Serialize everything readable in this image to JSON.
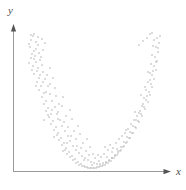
{
  "figure": {
    "width": 186,
    "height": 190,
    "background": "#ffffff",
    "type": "scatter-plot-figure"
  },
  "axes": {
    "color": "#9a9a9a",
    "arrow_color": "#555555",
    "line_width": 1,
    "origin": {
      "x": 13,
      "y": 172
    },
    "x_axis": {
      "from_x": 13,
      "to_x": 170,
      "y": 172,
      "arrow": "right-arrowhead"
    },
    "y_axis": {
      "x": 13,
      "from_y": 172,
      "to_y": 26,
      "arrow": "up-arrowhead"
    },
    "x_label": "x",
    "y_label": "y",
    "tick_labels_x": [],
    "tick_labels_y": []
  },
  "chart_data": {
    "type": "scatter",
    "title": "",
    "subtitle": "",
    "xlabel": "x",
    "ylabel": "y",
    "xlim": [
      0,
      186
    ],
    "ylim": [
      0,
      190
    ],
    "grid": false,
    "legend": null,
    "annotations": [],
    "marker": {
      "shape": "square-dot",
      "size_px": 1.4,
      "color": "#b4b4b4",
      "opacity": 0.95
    },
    "relationship": "u-shaped / quadratic",
    "vertex_px": {
      "x": 97,
      "y": 163
    },
    "n_points": 243,
    "points": [
      [
        31,
        40
      ],
      [
        33,
        36
      ],
      [
        36,
        42
      ],
      [
        30,
        47
      ],
      [
        34,
        51
      ],
      [
        38,
        45
      ],
      [
        35,
        56
      ],
      [
        31,
        58
      ],
      [
        39,
        53
      ],
      [
        36,
        62
      ],
      [
        33,
        66
      ],
      [
        40,
        60
      ],
      [
        37,
        71
      ],
      [
        42,
        65
      ],
      [
        34,
        74
      ],
      [
        39,
        78
      ],
      [
        43,
        72
      ],
      [
        37,
        82
      ],
      [
        41,
        86
      ],
      [
        45,
        79
      ],
      [
        39,
        90
      ],
      [
        44,
        93
      ],
      [
        48,
        86
      ],
      [
        42,
        97
      ],
      [
        46,
        101
      ],
      [
        50,
        94
      ],
      [
        44,
        104
      ],
      [
        48,
        108
      ],
      [
        52,
        101
      ],
      [
        46,
        111
      ],
      [
        51,
        114
      ],
      [
        55,
        107
      ],
      [
        49,
        117
      ],
      [
        53,
        121
      ],
      [
        57,
        114
      ],
      [
        51,
        124
      ],
      [
        56,
        127
      ],
      [
        60,
        120
      ],
      [
        54,
        130
      ],
      [
        58,
        133
      ],
      [
        62,
        126
      ],
      [
        57,
        135
      ],
      [
        61,
        138
      ],
      [
        65,
        131
      ],
      [
        59,
        140
      ],
      [
        64,
        143
      ],
      [
        68,
        136
      ],
      [
        62,
        145
      ],
      [
        66,
        148
      ],
      [
        70,
        141
      ],
      [
        65,
        150
      ],
      [
        69,
        152
      ],
      [
        73,
        146
      ],
      [
        67,
        154
      ],
      [
        72,
        156
      ],
      [
        76,
        150
      ],
      [
        70,
        157
      ],
      [
        75,
        159
      ],
      [
        79,
        153
      ],
      [
        73,
        160
      ],
      [
        78,
        162
      ],
      [
        82,
        156
      ],
      [
        76,
        163
      ],
      [
        81,
        164
      ],
      [
        85,
        158
      ],
      [
        79,
        165
      ],
      [
        84,
        166
      ],
      [
        88,
        160
      ],
      [
        82,
        166
      ],
      [
        87,
        167
      ],
      [
        91,
        162
      ],
      [
        85,
        167
      ],
      [
        90,
        168
      ],
      [
        94,
        163
      ],
      [
        88,
        168
      ],
      [
        93,
        168
      ],
      [
        97,
        164
      ],
      [
        91,
        168
      ],
      [
        96,
        168
      ],
      [
        100,
        164
      ],
      [
        94,
        168
      ],
      [
        99,
        167
      ],
      [
        103,
        163
      ],
      [
        97,
        167
      ],
      [
        102,
        166
      ],
      [
        106,
        162
      ],
      [
        100,
        166
      ],
      [
        105,
        165
      ],
      [
        109,
        160
      ],
      [
        103,
        165
      ],
      [
        108,
        163
      ],
      [
        112,
        158
      ],
      [
        106,
        163
      ],
      [
        111,
        161
      ],
      [
        115,
        156
      ],
      [
        109,
        161
      ],
      [
        114,
        158
      ],
      [
        118,
        153
      ],
      [
        112,
        158
      ],
      [
        117,
        155
      ],
      [
        121,
        150
      ],
      [
        115,
        155
      ],
      [
        120,
        151
      ],
      [
        124,
        146
      ],
      [
        118,
        151
      ],
      [
        123,
        147
      ],
      [
        127,
        142
      ],
      [
        121,
        147
      ],
      [
        126,
        143
      ],
      [
        130,
        138
      ],
      [
        124,
        142
      ],
      [
        129,
        138
      ],
      [
        133,
        133
      ],
      [
        127,
        137
      ],
      [
        132,
        133
      ],
      [
        136,
        128
      ],
      [
        130,
        132
      ],
      [
        135,
        127
      ],
      [
        139,
        122
      ],
      [
        133,
        126
      ],
      [
        138,
        121
      ],
      [
        142,
        116
      ],
      [
        136,
        120
      ],
      [
        141,
        114
      ],
      [
        145,
        109
      ],
      [
        139,
        113
      ],
      [
        144,
        107
      ],
      [
        148,
        102
      ],
      [
        142,
        106
      ],
      [
        146,
        100
      ],
      [
        150,
        95
      ],
      [
        144,
        98
      ],
      [
        149,
        92
      ],
      [
        152,
        87
      ],
      [
        146,
        90
      ],
      [
        151,
        84
      ],
      [
        154,
        79
      ],
      [
        148,
        82
      ],
      [
        152,
        75
      ],
      [
        156,
        70
      ],
      [
        150,
        73
      ],
      [
        154,
        66
      ],
      [
        157,
        61
      ],
      [
        151,
        64
      ],
      [
        155,
        57
      ],
      [
        158,
        52
      ],
      [
        152,
        55
      ],
      [
        156,
        47
      ],
      [
        159,
        43
      ],
      [
        153,
        46
      ],
      [
        157,
        38
      ],
      [
        160,
        36
      ],
      [
        29,
        44
      ],
      [
        32,
        54
      ],
      [
        36,
        49
      ],
      [
        29,
        63
      ],
      [
        34,
        59
      ],
      [
        38,
        68
      ],
      [
        32,
        70
      ],
      [
        41,
        57
      ],
      [
        43,
        50
      ],
      [
        45,
        43
      ],
      [
        40,
        75
      ],
      [
        36,
        86
      ],
      [
        43,
        82
      ],
      [
        47,
        75
      ],
      [
        50,
        68
      ],
      [
        46,
        92
      ],
      [
        50,
        84
      ],
      [
        53,
        78
      ],
      [
        52,
        110
      ],
      [
        56,
        96
      ],
      [
        55,
        88
      ],
      [
        59,
        104
      ],
      [
        63,
        97
      ],
      [
        58,
        112
      ],
      [
        62,
        106
      ],
      [
        66,
        116
      ],
      [
        70,
        110
      ],
      [
        64,
        122
      ],
      [
        68,
        127
      ],
      [
        72,
        119
      ],
      [
        74,
        131
      ],
      [
        78,
        126
      ],
      [
        71,
        136
      ],
      [
        76,
        139
      ],
      [
        80,
        134
      ],
      [
        83,
        143
      ],
      [
        87,
        139
      ],
      [
        81,
        148
      ],
      [
        86,
        151
      ],
      [
        90,
        147
      ],
      [
        93,
        154
      ],
      [
        98,
        155
      ],
      [
        95,
        158
      ],
      [
        101,
        157
      ],
      [
        104,
        154
      ],
      [
        108,
        150
      ],
      [
        105,
        147
      ],
      [
        110,
        145
      ],
      [
        113,
        148
      ],
      [
        116,
        143
      ],
      [
        119,
        139
      ],
      [
        122,
        136
      ],
      [
        125,
        133
      ],
      [
        128,
        129
      ],
      [
        131,
        124
      ],
      [
        134,
        120
      ],
      [
        137,
        116
      ],
      [
        140,
        111
      ],
      [
        143,
        104
      ],
      [
        147,
        96
      ],
      [
        145,
        87
      ],
      [
        150,
        80
      ],
      [
        153,
        71
      ],
      [
        156,
        62
      ],
      [
        158,
        48
      ],
      [
        154,
        40
      ],
      [
        150,
        34
      ],
      [
        34,
        34
      ],
      [
        38,
        37
      ],
      [
        42,
        39
      ],
      [
        31,
        35
      ],
      [
        147,
        38
      ],
      [
        143,
        41
      ],
      [
        139,
        45
      ],
      [
        152,
        33
      ],
      [
        48,
        115
      ],
      [
        58,
        119
      ],
      [
        67,
        143
      ],
      [
        77,
        146
      ],
      [
        89,
        155
      ],
      [
        99,
        161
      ],
      [
        107,
        157
      ],
      [
        117,
        149
      ],
      [
        126,
        130
      ],
      [
        135,
        112
      ],
      [
        141,
        95
      ],
      [
        148,
        72
      ],
      [
        44,
        120
      ],
      [
        54,
        137
      ],
      [
        63,
        151
      ],
      [
        84,
        160
      ],
      [
        92,
        165
      ],
      [
        112,
        152
      ]
    ]
  }
}
